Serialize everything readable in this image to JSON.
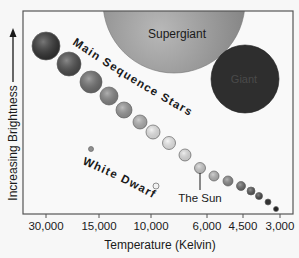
{
  "x_axis": {
    "label": "Temperature (Kelvin)",
    "ticks": [
      {
        "label": "30,000",
        "x": 46
      },
      {
        "label": "15,000",
        "x": 99
      },
      {
        "label": "10,000",
        "x": 151
      },
      {
        "label": "6,000",
        "x": 207
      },
      {
        "label": "4,500",
        "x": 243
      },
      {
        "label": "3,000",
        "x": 280
      }
    ]
  },
  "y_axis": {
    "label": "Increasing Brightness",
    "arrow": "arrow-up-icon"
  },
  "regions": {
    "supergiant": "Supergiant",
    "giant": "Giant",
    "main_sequence": "Main Sequence Stars",
    "white_dwarfs": "White Dwarfs",
    "sun": "The Sun"
  },
  "colors": {
    "background": "#f7f7f7",
    "frame": "#555555",
    "supergiant": "#9a9a9a",
    "giant": "#2e2e2e",
    "text": "#1a1a1a"
  },
  "stars": {
    "main_sequence": [
      {
        "cx": 46,
        "cy": 46,
        "r": 14,
        "fill": "#2f2f2f"
      },
      {
        "cx": 69,
        "cy": 64,
        "r": 12,
        "fill": "#4a4a4a"
      },
      {
        "cx": 91,
        "cy": 82,
        "r": 11,
        "fill": "#6e6e6e"
      },
      {
        "cx": 109,
        "cy": 96,
        "r": 9,
        "fill": "#858585"
      },
      {
        "cx": 124,
        "cy": 110,
        "r": 8,
        "fill": "#999999"
      },
      {
        "cx": 140,
        "cy": 122,
        "r": 7,
        "fill": "#b3b3b3"
      },
      {
        "cx": 153,
        "cy": 132,
        "r": 7,
        "fill": "#ececec"
      },
      {
        "cx": 169,
        "cy": 143,
        "r": 6.5,
        "fill": "#f2f2f2"
      },
      {
        "cx": 185,
        "cy": 155,
        "r": 6,
        "fill": "#e6e6e6"
      },
      {
        "cx": 200,
        "cy": 168,
        "r": 5.5,
        "fill": "#cfcfcf"
      },
      {
        "cx": 214,
        "cy": 176,
        "r": 5,
        "fill": "#b8b8b8"
      },
      {
        "cx": 228,
        "cy": 181,
        "r": 5,
        "fill": "#8a8a8a"
      },
      {
        "cx": 241,
        "cy": 186,
        "r": 4.5,
        "fill": "#6a6a6a"
      },
      {
        "cx": 251,
        "cy": 191,
        "r": 4,
        "fill": "#555555"
      },
      {
        "cx": 259,
        "cy": 196,
        "r": 3.5,
        "fill": "#444444"
      },
      {
        "cx": 268,
        "cy": 202,
        "r": 3,
        "fill": "#333333"
      },
      {
        "cx": 276,
        "cy": 209,
        "r": 2.5,
        "fill": "#222222"
      }
    ],
    "white_dwarfs": [
      {
        "cx": 91,
        "cy": 149,
        "r": 2.5,
        "fill": "#8f8f8f"
      },
      {
        "cx": 156,
        "cy": 186,
        "r": 3,
        "fill": "#f2f2f2"
      }
    ]
  }
}
